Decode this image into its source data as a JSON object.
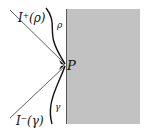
{
  "diagram": {
    "labels": {
      "future_boundary": "I⁺(ρ)",
      "past_boundary": "I⁻(γ)",
      "rho": "ρ",
      "gamma": "γ",
      "point": "P"
    },
    "colors": {
      "region_fill": "#c2c2c2",
      "region_edge": "#5a5a5a",
      "line": "#333333",
      "curve": "#111111"
    }
  }
}
